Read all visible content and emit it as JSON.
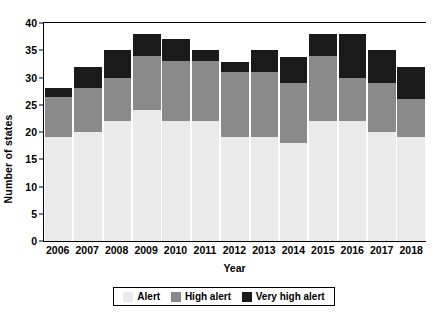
{
  "chart_data": {
    "type": "bar",
    "stacked": true,
    "title": "",
    "xlabel": "Year",
    "ylabel": "Number of states",
    "categories": [
      "2006",
      "2007",
      "2008",
      "2009",
      "2010",
      "2011",
      "2012",
      "2013",
      "2014",
      "2015",
      "2016",
      "2017",
      "2018"
    ],
    "series": [
      {
        "name": "Alert",
        "color": "#eaeaea",
        "values": [
          19,
          20,
          22,
          24,
          22,
          22,
          19,
          19,
          18,
          22,
          22,
          20,
          19
        ]
      },
      {
        "name": "High alert",
        "color": "#8a8a8a",
        "values": [
          7.5,
          8,
          8,
          10,
          11,
          11,
          12,
          12,
          11,
          12,
          8,
          9,
          7
        ]
      },
      {
        "name": "Very high alert",
        "color": "#1a1a1a",
        "values": [
          1.5,
          4,
          5,
          4,
          4,
          2,
          1.8,
          4,
          4.8,
          4,
          8,
          6,
          6
        ]
      }
    ],
    "totals": [
      28,
      32,
      35,
      38,
      37,
      35,
      32.8,
      35,
      33.8,
      38,
      38,
      35,
      32
    ],
    "ylim": [
      0,
      40
    ],
    "yticks": [
      0,
      5,
      10,
      15,
      20,
      25,
      30,
      35,
      40
    ],
    "ytick_labels": [
      "0",
      "5",
      "10",
      "15",
      "20",
      "25",
      "30",
      "35",
      "40"
    ],
    "grid": false,
    "legend_position": "bottom"
  },
  "legend": {
    "items": [
      {
        "label": "Alert",
        "color": "#eaeaea"
      },
      {
        "label": "High alert",
        "color": "#8a8a8a"
      },
      {
        "label": "Very high alert",
        "color": "#1a1a1a"
      }
    ]
  }
}
